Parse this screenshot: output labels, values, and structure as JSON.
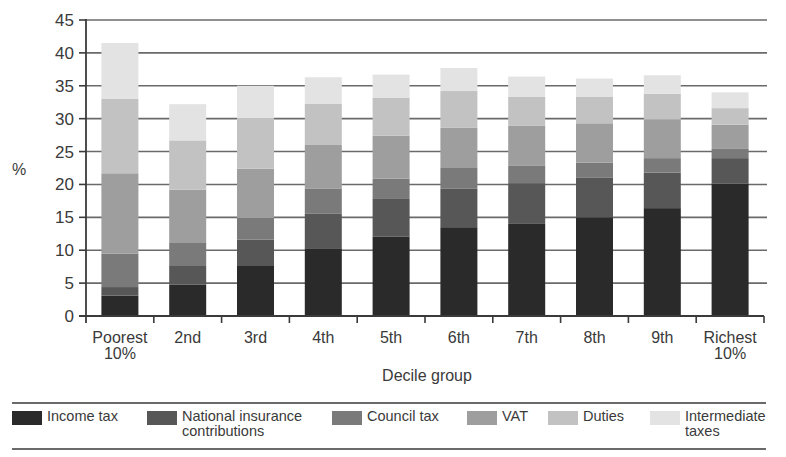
{
  "chart_data": {
    "type": "bar",
    "stacked": true,
    "title": "",
    "xlabel": "Decile group",
    "ylabel": "%",
    "ylim": [
      0,
      45
    ],
    "yticks": [
      0,
      5,
      10,
      15,
      20,
      25,
      30,
      35,
      40,
      45
    ],
    "grid": true,
    "legend_position": "bottom",
    "categories": [
      "Poorest\n10%",
      "2nd",
      "3rd",
      "4th",
      "5th",
      "6th",
      "7th",
      "8th",
      "9th",
      "Richest\n10%"
    ],
    "series": [
      {
        "name": "Income tax",
        "color": "#2a2a2a",
        "values": [
          3.1,
          4.8,
          7.6,
          10.3,
          12.1,
          13.5,
          14.0,
          15.0,
          16.4,
          20.1
        ]
      },
      {
        "name": "National insurance contributions",
        "color": "#575757",
        "values": [
          1.3,
          2.8,
          4.0,
          5.3,
          5.8,
          5.9,
          6.2,
          6.0,
          5.4,
          3.9
        ]
      },
      {
        "name": "Council tax",
        "color": "#7a7a7a",
        "values": [
          5.1,
          3.5,
          3.3,
          3.8,
          3.0,
          3.1,
          2.7,
          2.3,
          2.2,
          1.4
        ]
      },
      {
        "name": "VAT",
        "color": "#9e9e9e",
        "values": [
          12.2,
          8.1,
          7.5,
          6.6,
          6.5,
          6.1,
          6.0,
          6.0,
          5.9,
          3.7
        ]
      },
      {
        "name": "Duties",
        "color": "#c2c2c2",
        "values": [
          11.3,
          7.5,
          7.7,
          6.3,
          5.8,
          5.6,
          4.4,
          4.0,
          3.9,
          2.5
        ]
      },
      {
        "name": "Intermediate taxes",
        "color": "#e3e3e3",
        "values": [
          8.5,
          5.5,
          4.9,
          4.0,
          3.5,
          3.5,
          3.1,
          2.8,
          2.8,
          2.4
        ]
      }
    ]
  },
  "legend": {
    "items": [
      {
        "label": "Income tax",
        "color": "#2a2a2a",
        "x": 0
      },
      {
        "label": "National insurance\ncontributions",
        "color": "#575757",
        "x": 135
      },
      {
        "label": "Council tax",
        "color": "#7a7a7a",
        "x": 320
      },
      {
        "label": "VAT",
        "color": "#9e9e9e",
        "x": 455
      },
      {
        "label": "Duties",
        "color": "#c2c2c2",
        "x": 536
      },
      {
        "label": "Intermediate\ntaxes",
        "color": "#e3e3e3",
        "x": 638
      }
    ]
  },
  "colors": {
    "axis": "#3a3a3a",
    "gridline": "#6a6a6a"
  }
}
